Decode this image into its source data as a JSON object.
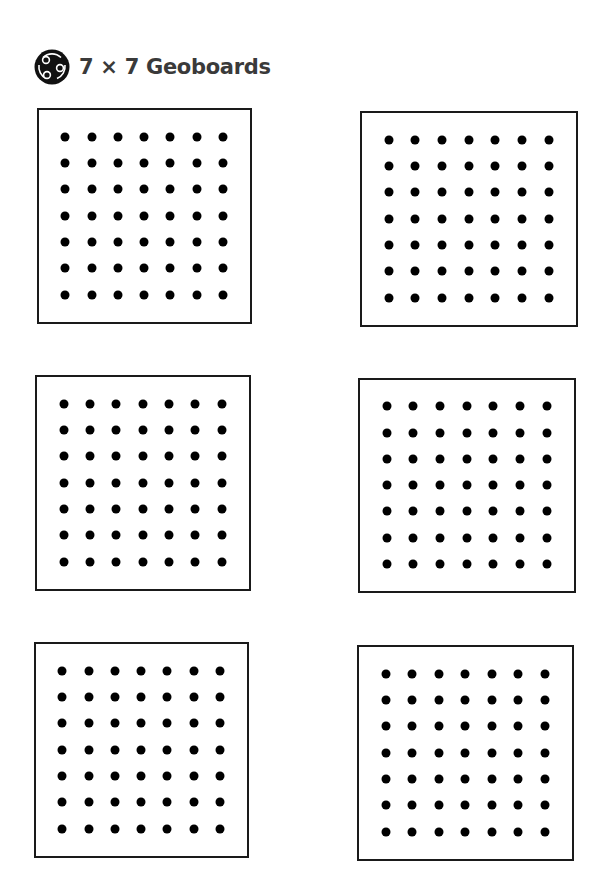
{
  "header": {
    "icon": "geoboard-logo-icon",
    "title": "7 × 7 Geoboards"
  },
  "geoboards": {
    "rows": 7,
    "cols": 7,
    "border_color": "#1a1a1a",
    "dot_color": "#000000",
    "boards": [
      {
        "id": 1,
        "x": 37,
        "y": 108,
        "w": 215,
        "h": 216
      },
      {
        "id": 2,
        "x": 360,
        "y": 111,
        "w": 218,
        "h": 216
      },
      {
        "id": 3,
        "x": 35,
        "y": 375,
        "w": 216,
        "h": 216
      },
      {
        "id": 4,
        "x": 358,
        "y": 378,
        "w": 218,
        "h": 215
      },
      {
        "id": 5,
        "x": 34,
        "y": 642,
        "w": 215,
        "h": 216
      },
      {
        "id": 6,
        "x": 357,
        "y": 645,
        "w": 217,
        "h": 216
      }
    ]
  }
}
